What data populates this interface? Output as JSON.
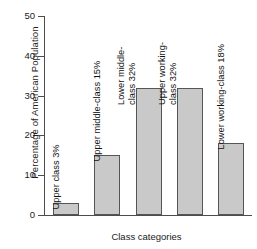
{
  "chart_data": {
    "type": "bar",
    "title": "",
    "xlabel": "Class categories",
    "ylabel": "Percentage of American Population",
    "categories": [
      "Upper class",
      "Upper middle-class",
      "Lower middle-class",
      "Upper working-class",
      "Lower working-class"
    ],
    "values": [
      3,
      15,
      32,
      32,
      18
    ],
    "bar_labels": [
      "Upper class 3%",
      "Upper middle-class 15%",
      "Lower middle-\nclass 32%",
      "Upper working-\nclass 32%",
      "Lower working-class 18%"
    ],
    "ylim": [
      0,
      50
    ],
    "yticks": [
      0,
      10,
      20,
      30,
      40,
      50
    ],
    "ytick_labels": [
      "0",
      "10",
      "20",
      "30",
      "40",
      "50"
    ],
    "grid": false,
    "legend": "none",
    "bar_color": "#c9c9c9",
    "bar_edge_color": "#555555",
    "axis_color": "#4d4d4d"
  }
}
